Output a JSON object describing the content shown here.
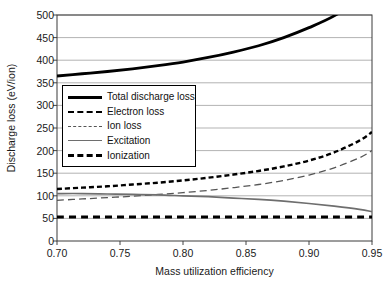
{
  "chart_data": {
    "type": "line",
    "title": "",
    "xlabel": "Mass utilization efficiency",
    "ylabel": "Discharge loss (eV/ion)",
    "xlim": [
      0.7,
      0.95
    ],
    "ylim": [
      0,
      500
    ],
    "xticks": [
      "0.70",
      "0.75",
      "0.80",
      "0.85",
      "0.90",
      "0.95"
    ],
    "xtick_values": [
      0.7,
      0.75,
      0.8,
      0.85,
      0.9,
      0.95
    ],
    "yticks": [
      "0",
      "50",
      "100",
      "150",
      "200",
      "250",
      "300",
      "350",
      "400",
      "450",
      "500"
    ],
    "ytick_values": [
      0,
      50,
      100,
      150,
      200,
      250,
      300,
      350,
      400,
      450,
      500
    ],
    "grid": "horizontal",
    "grid_color": "#b3b3b3",
    "legend_position": "upper left",
    "x": [
      0.7,
      0.72,
      0.74,
      0.76,
      0.78,
      0.8,
      0.82,
      0.84,
      0.86,
      0.88,
      0.9,
      0.92,
      0.94,
      0.95
    ],
    "series": [
      {
        "name": "Total discharge loss",
        "style": "thick-solid",
        "color": "#000000",
        "values": [
          365,
          370,
          375,
          381,
          388,
          396,
          406,
          418,
          432,
          450,
          472,
          498,
          535,
          560
        ]
      },
      {
        "name": "Electron loss",
        "style": "short-dash",
        "color": "#000000",
        "values": [
          115,
          118,
          121,
          125,
          129,
          134,
          140,
          147,
          155,
          165,
          178,
          196,
          222,
          241
        ]
      },
      {
        "name": "Ion loss",
        "style": "long-dash-thin",
        "color": "#555555",
        "values": [
          90,
          93,
          96,
          99,
          103,
          107,
          112,
          118,
          125,
          134,
          146,
          162,
          184,
          200
        ]
      },
      {
        "name": "Excitation",
        "style": "solid-gray",
        "color": "#6e6e6e",
        "values": [
          105,
          105,
          104,
          103,
          102,
          100,
          98,
          95,
          92,
          88,
          83,
          77,
          70,
          65
        ]
      },
      {
        "name": "Ionization",
        "style": "thick-long-dash",
        "color": "#000000",
        "values": [
          53,
          53,
          53,
          53,
          53,
          53,
          53,
          53,
          53,
          53,
          53,
          53,
          53,
          53
        ]
      }
    ],
    "annotations": [
      "Total discharge loss curve exits the top of the plot near x = 0.935",
      "Ion loss crosses Excitation near x = 0.78",
      "Ionization remains constant at about 53 eV/ion"
    ]
  },
  "legend": {
    "items": [
      {
        "label": "Total discharge loss"
      },
      {
        "label": "Electron loss"
      },
      {
        "label": "Ion loss"
      },
      {
        "label": "Excitation"
      },
      {
        "label": "Ionization"
      }
    ]
  }
}
